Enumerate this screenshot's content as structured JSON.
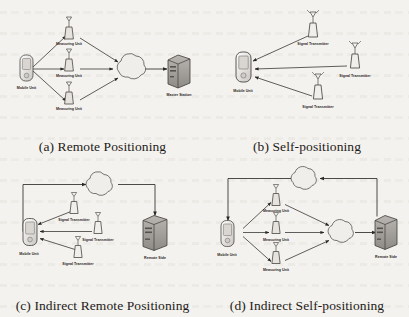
{
  "figure": {
    "type": "diagram-grid",
    "rows": 2,
    "columns": 2,
    "background_color": "#f4f2ee",
    "ink_color": "#2a2724",
    "note": "scanned figure with faint text bleed-through in background"
  },
  "panels": [
    {
      "id": "a",
      "caption": "(a) Remote Positioning",
      "nodes": {
        "mobile_unit": "Mobile Unit",
        "measuring_unit_1": "Measuring Unit",
        "measuring_unit_2": "Measuring Unit",
        "measuring_unit_3": "Measuring Unit",
        "cloud": "",
        "station": "Master Station"
      },
      "flow": "Mobile Unit -> 3x Measuring Unit -> network cloud -> Master Station"
    },
    {
      "id": "b",
      "caption": "(b) Self-positioning",
      "nodes": {
        "mobile_unit": "Mobile Unit",
        "transmitter_1": "Signal Transmitter",
        "transmitter_2": "Signal Transmitter",
        "transmitter_3": "Signal Transmitter"
      },
      "flow": "3x Signal Transmitter -> Mobile Unit"
    },
    {
      "id": "c",
      "caption": "(c) Indirect Remote Positioning",
      "nodes": {
        "mobile_unit": "Mobile Unit",
        "transmitter_1": "Signal Transmitter",
        "transmitter_2": "Signal Transmitter",
        "transmitter_3": "Signal Transmitter",
        "cloud": "",
        "station": "Remote Side"
      },
      "flow": "3x Signal Transmitter -> Mobile Unit -> network cloud -> Remote Side"
    },
    {
      "id": "d",
      "caption": "(d) Indirect Self-positioning",
      "nodes": {
        "mobile_unit": "Mobile Unit",
        "measuring_unit_1": "Measuring Unit",
        "measuring_unit_2": "Measuring Unit",
        "measuring_unit_3": "Measuring Unit",
        "cloud_lower": "",
        "cloud_upper": "",
        "station": "Remote Side"
      },
      "flow": "Mobile Unit -> 3x Measuring Unit -> cloud -> Remote Side -> upper cloud -> back to Mobile Unit"
    }
  ]
}
